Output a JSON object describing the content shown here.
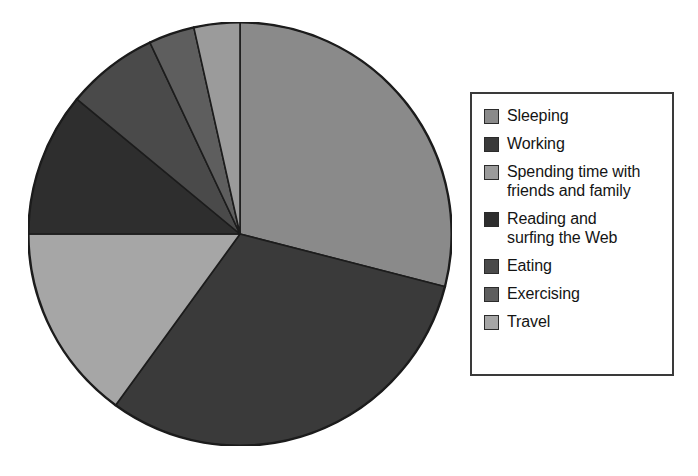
{
  "chart_data": {
    "type": "pie",
    "title": "",
    "subtitle": "",
    "xlabel": "",
    "ylabel": "",
    "grid": false,
    "legend_position": "right",
    "start_angle_deg": 0,
    "direction": "clockwise",
    "center": {
      "x": 240,
      "y": 234
    },
    "radius": 212,
    "categories": [
      "Sleeping",
      "Working",
      "Spending time with\nfriends and family",
      "Reading and\nsurfing the Web",
      "Eating",
      "Exercising",
      "Travel"
    ],
    "values": [
      29,
      31,
      3.5,
      11,
      7,
      3.5,
      15
    ],
    "slices": [
      {
        "label": "Sleeping",
        "value": 29,
        "color": "#8a8a8a",
        "start_deg": 0,
        "end_deg": 104.4
      },
      {
        "label": "Working",
        "value": 31,
        "color": "#3a3a3a",
        "start_deg": 104.4,
        "end_deg": 216.0
      },
      {
        "label": "Travel",
        "value": 15,
        "color": "#a6a6a6",
        "start_deg": 216.0,
        "end_deg": 270.0
      },
      {
        "label": "Reading and surfing the Web",
        "value": 11,
        "color": "#2e2e2e",
        "start_deg": 270.0,
        "end_deg": 309.6
      },
      {
        "label": "Eating",
        "value": 7,
        "color": "#4a4a4a",
        "start_deg": 309.6,
        "end_deg": 334.8
      },
      {
        "label": "Exercising",
        "value": 3.5,
        "color": "#5e5e5e",
        "start_deg": 334.8,
        "end_deg": 347.4
      },
      {
        "label": "Spending time with friends and family",
        "value": 3.5,
        "color": "#9b9b9b",
        "start_deg": 347.4,
        "end_deg": 360.0
      }
    ]
  },
  "legend": {
    "items": [
      {
        "label": "Sleeping",
        "color": "#8a8a8a"
      },
      {
        "label": "Working",
        "color": "#3a3a3a"
      },
      {
        "label": "Spending time with\nfriends and family",
        "color": "#9b9b9b"
      },
      {
        "label": "Reading and\nsurfing the Web",
        "color": "#2e2e2e"
      },
      {
        "label": "Eating",
        "color": "#4a4a4a"
      },
      {
        "label": "Exercising",
        "color": "#5e5e5e"
      },
      {
        "label": "Travel",
        "color": "#a6a6a6"
      }
    ]
  },
  "style": {
    "background": "#ffffff",
    "slice_outline": "#1c1c1c",
    "legend_border": "#3a3a3a",
    "text_color": "#141414"
  }
}
